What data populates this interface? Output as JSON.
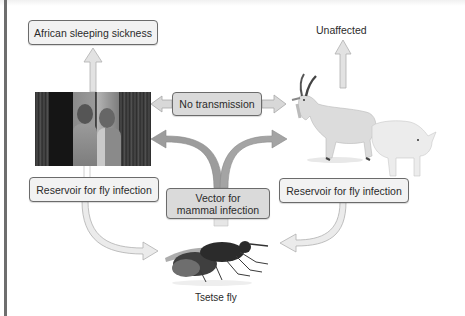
{
  "diagram": {
    "nodes": {
      "disease": {
        "label": "African sleeping sickness"
      },
      "no_transmission": {
        "label": "No transmission"
      },
      "unaffected": {
        "label": "Unaffected"
      },
      "reservoir_left": {
        "label": "Reservoir for fly infection"
      },
      "reservoir_right": {
        "label": "Reservoir for fly infection"
      },
      "vector": {
        "label_line1": "Vector for",
        "label_line2": "mammal infection"
      },
      "fly": {
        "label": "Tsetse fly"
      }
    },
    "images": {
      "humans": "children-photo",
      "animals": "goat-and-pig-photo",
      "insect": "tsetse-fly-photo"
    },
    "edges": [
      {
        "from": "humans",
        "to": "disease"
      },
      {
        "from": "animals",
        "to": "unaffected"
      },
      {
        "from": "no_transmission",
        "to": "humans"
      },
      {
        "from": "no_transmission",
        "to": "animals"
      },
      {
        "from": "fly",
        "to": "humans",
        "via": "vector"
      },
      {
        "from": "fly",
        "to": "animals",
        "via": "vector"
      },
      {
        "from": "humans",
        "to": "fly",
        "via": "reservoir_left"
      },
      {
        "from": "animals",
        "to": "fly",
        "via": "reservoir_right"
      }
    ],
    "colors": {
      "arrow_fill": "#d9d9d9",
      "arrow_stroke": "#a8a8a8",
      "arrow_dark_fill": "#9a9a9a",
      "box_fill": "#f2f2f2",
      "box_dark_fill": "#dadada",
      "box_border": "#6b6b6b",
      "left_rule": "#6e6e6e"
    }
  }
}
